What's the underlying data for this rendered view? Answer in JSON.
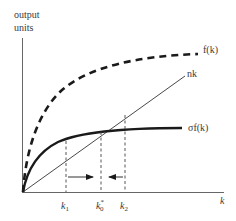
{
  "diagram": {
    "type": "solow-growth-model",
    "y_axis_label_line1": "output",
    "y_axis_label_line2": "units",
    "x_axis_label": "k",
    "curves": {
      "production": {
        "label": "f(k)",
        "style": "dashed-thick"
      },
      "savings": {
        "label": "σf(k)",
        "style": "solid-thick"
      },
      "depreciation": {
        "label": "nk",
        "style": "solid-thin"
      }
    },
    "ticks": {
      "k1": {
        "base": "k",
        "sub": "1"
      },
      "k0": {
        "base": "k",
        "sub": "0",
        "sup": "*"
      },
      "k2": {
        "base": "k",
        "sub": "2"
      }
    },
    "arrows": [
      {
        "from": "k1",
        "to": "k0",
        "direction": "right"
      },
      {
        "from": "k2",
        "to": "k0",
        "direction": "left"
      }
    ],
    "colors": {
      "ink": "#1a1a1a",
      "axis": "#555555",
      "label": "#3a3a3a"
    }
  }
}
